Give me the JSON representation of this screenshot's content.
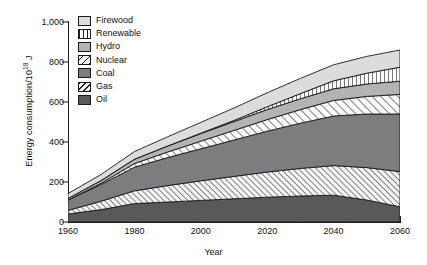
{
  "chart_data": {
    "type": "area",
    "title": "",
    "xlabel": "Year",
    "ylabel": "Energy consumption/10^18 J",
    "ylabel_prefix": "Energy consumption/10",
    "ylabel_exponent": "18",
    "ylabel_suffix": " J",
    "stacked": true,
    "xlim": [
      1960,
      2060
    ],
    "ylim": [
      0,
      1000
    ],
    "xticks": [
      1960,
      1980,
      2000,
      2020,
      2040,
      2060
    ],
    "xtick_labels": [
      "1960",
      "1980",
      "2000",
      "2020",
      "2040",
      "2060"
    ],
    "yticks": [
      0,
      200,
      400,
      600,
      800,
      1000
    ],
    "ytick_labels": [
      "0",
      "200",
      "400",
      "600",
      "800",
      "1,000"
    ],
    "grid": false,
    "legend_position": "top-left-inside",
    "x": [
      1960,
      1970,
      1980,
      1990,
      2000,
      2010,
      2020,
      2030,
      2040,
      2050,
      2060
    ],
    "series": [
      {
        "name": "Oil",
        "fill": "#59595b",
        "pattern": "solid",
        "values": [
          40,
          62,
          92,
          100,
          108,
          116,
          124,
          130,
          134,
          110,
          76
        ]
      },
      {
        "name": "Gas",
        "fill": "#f2f2f2",
        "pattern": "diagonal-hatch-dense",
        "values": [
          18,
          42,
          64,
          82,
          98,
          112,
          126,
          138,
          148,
          162,
          176
        ]
      },
      {
        "name": "Coal",
        "fill": "#7d7d7f",
        "pattern": "solid",
        "values": [
          52,
          84,
          118,
          140,
          160,
          182,
          204,
          226,
          248,
          268,
          288
        ]
      },
      {
        "name": "Nuclear",
        "fill": "#fafafa",
        "pattern": "diagonal-hatch",
        "values": [
          0,
          6,
          18,
          28,
          38,
          48,
          58,
          68,
          78,
          88,
          98
        ]
      },
      {
        "name": "Hydro",
        "fill": "#b3b3b3",
        "pattern": "solid",
        "values": [
          8,
          14,
          22,
          30,
          38,
          44,
          50,
          54,
          58,
          62,
          66
        ]
      },
      {
        "name": "Renewable",
        "fill": "#fafafa",
        "pattern": "vertical-lines",
        "values": [
          0,
          0,
          0,
          0,
          2,
          6,
          14,
          26,
          40,
          54,
          70
        ]
      },
      {
        "name": "Firewood",
        "fill": "#dcdcdc",
        "pattern": "solid",
        "values": [
          24,
          30,
          38,
          46,
          54,
          62,
          70,
          76,
          80,
          84,
          86
        ]
      }
    ],
    "legend_order": [
      "Firewood",
      "Renewable",
      "Hydro",
      "Nuclear",
      "Coal",
      "Gas",
      "Oil"
    ]
  }
}
